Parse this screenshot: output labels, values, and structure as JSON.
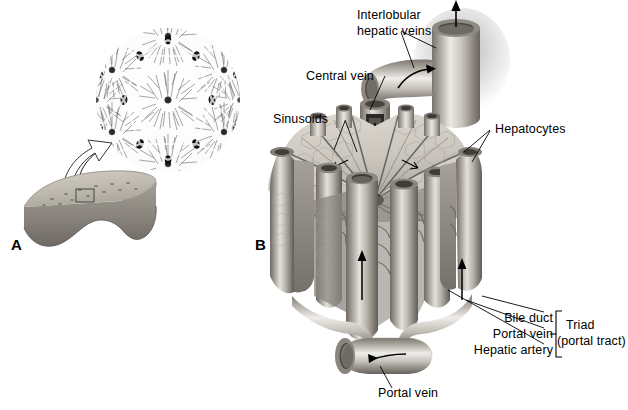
{
  "figure": {
    "background": "#ffffff",
    "width": 628,
    "height": 410
  },
  "panels": [
    {
      "id": "A",
      "letter": "A",
      "caption": "Liver organ with histologic lobule inset"
    },
    {
      "id": "B",
      "letter": "B",
      "caption": "Three-dimensional liver lobule"
    }
  ],
  "labels": {
    "interlobular_hepatic_veins_line1": "Interlobular",
    "interlobular_hepatic_veins_line2": "hepatic veins",
    "central_vein": "Central vein",
    "sinusoids": "Sinusoids",
    "hepatocytes": "Hepatocytes",
    "bile_duct": "Bile duct",
    "portal_vein_triad": "Portal vein",
    "hepatic_artery": "Hepatic artery",
    "triad": "Triad",
    "portal_tract": "(portal tract)",
    "portal_vein_bottom": "Portal vein"
  },
  "colors": {
    "ink": "#000000",
    "background": "#ffffff",
    "tissue_light": "#d8d4cd",
    "tissue_mid": "#a9a49c",
    "tissue_dark": "#6f6a63",
    "vessel_light": "#e2ded7",
    "vessel_mid": "#9b968e",
    "vessel_dark": "#5d5953",
    "liver_fill": "#b9b4aa",
    "histology_ink": "#4a4a4a"
  },
  "icons": {
    "flow_arrow": "arrow-icon",
    "magnify_arrow": "magnify-arrow-icon",
    "bracket": "bracket-icon"
  }
}
